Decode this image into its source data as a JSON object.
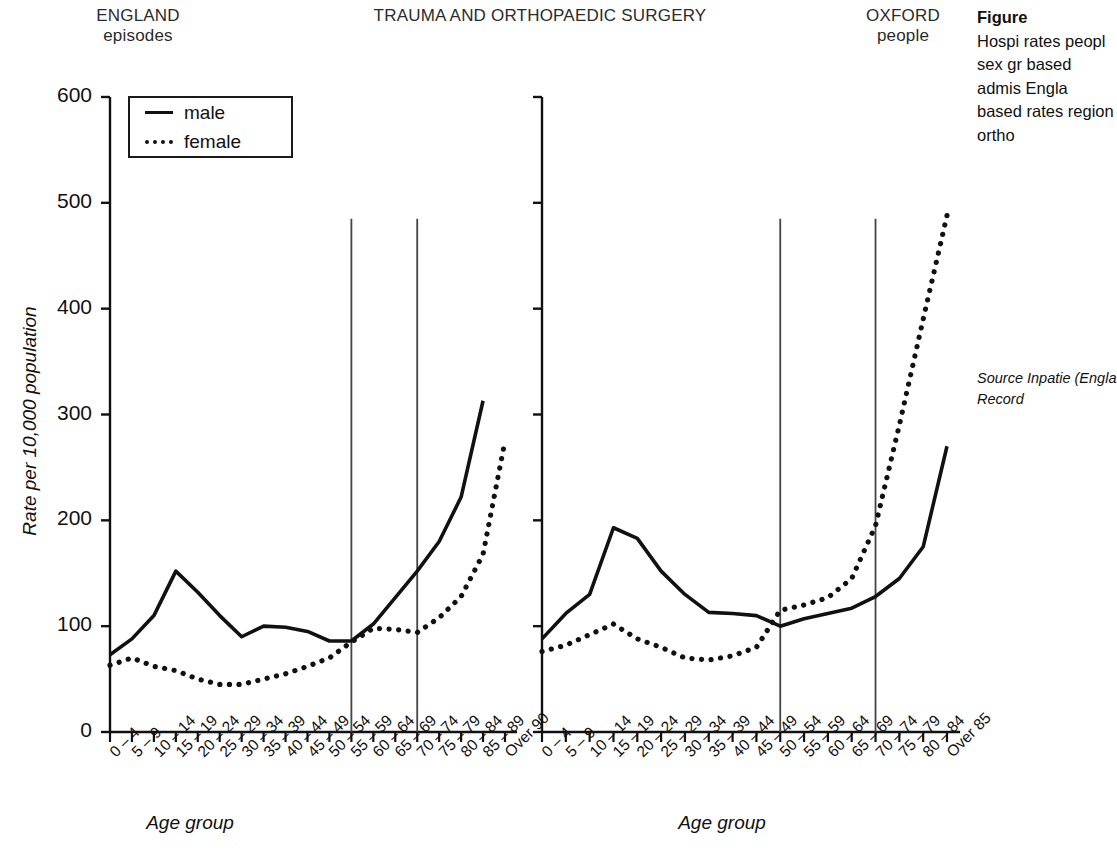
{
  "header": {
    "left_region": "ENGLAND",
    "left_region_unit": "episodes",
    "title": "TRAUMA AND ORTHOPAEDIC SURGERY",
    "right_region": "OXFORD",
    "right_region_unit": "people"
  },
  "caption": {
    "label": "Figure",
    "body": "Hospi rates peopl sex gr based admis Engla based rates region ortho",
    "source": "Source Inpatie (Engla Record"
  },
  "legend": {
    "position": "top-left-of-left-panel",
    "entries": [
      {
        "label": "male",
        "style": "solid",
        "key": "line-solid-icon"
      },
      {
        "label": "female",
        "style": "dotted",
        "key": "line-dotted-icon"
      }
    ]
  },
  "axes": {
    "ylabel": "Rate per 10,000 population",
    "xlabel": "Age group",
    "yticks": [
      0,
      100,
      200,
      300,
      400,
      500,
      600
    ],
    "ylim": [
      0,
      600
    ],
    "grid": false
  },
  "colors": {
    "line": "#111111",
    "axis": "#111111",
    "reference_line": "#444444",
    "background": "#ffffff"
  },
  "chart_data": [
    {
      "id": "england-episodes",
      "type": "line",
      "title": "ENGLAND episodes",
      "subtitle": "episodes",
      "xlabel": "Age group",
      "ylabel": "Rate per 10,000 population",
      "ylim": [
        0,
        600
      ],
      "yticks": [
        0,
        100,
        200,
        300,
        400,
        500,
        600
      ],
      "grid": false,
      "legend_position": "upper-left",
      "categories": [
        "0 – 4",
        "5 – 9",
        "10 – 14",
        "15 – 19",
        "20 – 24",
        "25 – 29",
        "30 – 34",
        "35 – 39",
        "40 – 44",
        "45 – 49",
        "50 – 54",
        "55 – 59",
        "60 – 64",
        "65 – 69",
        "70 – 74",
        "75 – 79",
        "80 – 84",
        "85 – 89",
        "Over 90"
      ],
      "series": [
        {
          "name": "male",
          "style": "solid",
          "values": [
            73,
            88,
            110,
            152,
            132,
            110,
            90,
            100,
            99,
            95,
            86,
            86,
            102,
            127,
            152,
            180,
            222,
            313,
            null
          ]
        },
        {
          "name": "female",
          "style": "dotted",
          "values": [
            63,
            70,
            62,
            58,
            50,
            45,
            45,
            50,
            55,
            62,
            70,
            85,
            98,
            97,
            94,
            108,
            128,
            168,
            275
          ]
        }
      ],
      "reference_lines": [
        {
          "at_category": "55 – 59",
          "value_top": 485
        },
        {
          "at_category": "70 – 74",
          "value_top": 485
        }
      ]
    },
    {
      "id": "oxford-people",
      "type": "line",
      "title": "OXFORD people",
      "subtitle": "people",
      "xlabel": "Age group",
      "ylabel": "Rate per 10,000 population",
      "ylim": [
        0,
        600
      ],
      "yticks": [
        0,
        100,
        200,
        300,
        400,
        500,
        600
      ],
      "grid": false,
      "legend_position": "none",
      "categories": [
        "0 – 4",
        "5 – 9",
        "10 – 14",
        "15 – 19",
        "20 – 24",
        "25 – 29",
        "30 – 34",
        "35 – 39",
        "40 – 44",
        "45 – 49",
        "50 – 54",
        "55 – 59",
        "60 – 64",
        "65 – 69",
        "70 – 74",
        "75 – 79",
        "80 – 84",
        "Over 85"
      ],
      "series": [
        {
          "name": "male",
          "style": "solid",
          "values": [
            88,
            112,
            130,
            193,
            183,
            152,
            130,
            113,
            112,
            110,
            100,
            107,
            112,
            117,
            128,
            145,
            175,
            270
          ]
        },
        {
          "name": "female",
          "style": "dotted",
          "values": [
            76,
            82,
            92,
            102,
            88,
            80,
            70,
            68,
            72,
            80,
            115,
            120,
            127,
            145,
            195,
            290,
            390,
            488
          ]
        }
      ],
      "reference_lines": [
        {
          "at_category": "50 – 54",
          "value_top": 485
        },
        {
          "at_category": "70 – 74",
          "value_top": 485
        }
      ]
    }
  ]
}
